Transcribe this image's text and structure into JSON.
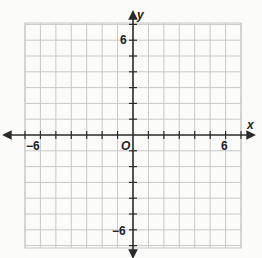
{
  "diagram": {
    "type": "coordinate-plane",
    "x_axis": {
      "label": "x",
      "min": -7,
      "max": 7,
      "tick_step": 1,
      "labeled_ticks": [
        {
          "value": -6,
          "text": "−6"
        },
        {
          "value": 6,
          "text": "6"
        }
      ]
    },
    "y_axis": {
      "label": "y",
      "min": -7,
      "max": 7,
      "tick_step": 1,
      "labeled_ticks": [
        {
          "value": 6,
          "text": "6"
        },
        {
          "value": -6,
          "text": "−6"
        }
      ]
    },
    "origin_label": "O",
    "colors": {
      "grid": "#c8c8c8",
      "axis": "#2a2a2a",
      "background": "#fbfbfa"
    }
  }
}
